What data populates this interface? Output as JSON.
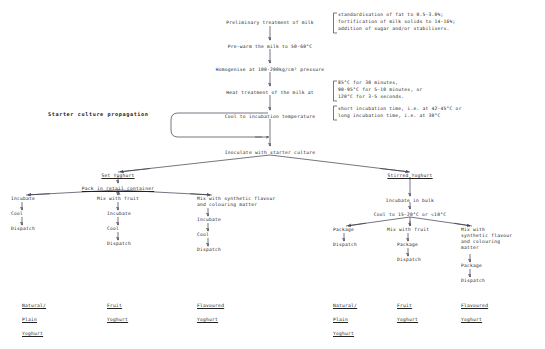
{
  "diagram": {
    "main_chain": [
      {
        "id": "prelim",
        "text": "Preliminary treatment of milk"
      },
      {
        "id": "prewarm",
        "text": "Pre-warm the milk to 50-60°C"
      },
      {
        "id": "homogenise",
        "text": "Homogenise at 100-200kg/cm² pressure"
      },
      {
        "id": "heat",
        "text": "Heat treatment of the milk at"
      },
      {
        "id": "cool",
        "text": "Cool to incubation temperature"
      },
      {
        "id": "inoculate",
        "text": "Inoculate with starter culture"
      }
    ],
    "brackets": [
      {
        "id": "prelim-note",
        "lines": [
          "standardisation of fat to 0.5-3.0%;",
          "fortification of milk solids to 14-16%;",
          "addition of sugar and/or stabilisers."
        ]
      },
      {
        "id": "heat-note",
        "lines": [
          "85°C for 30 minutes,",
          "90-95°C for 5-10 minutes, or",
          "120°C for 3-5 seconds."
        ]
      },
      {
        "id": "cool-note",
        "lines": [
          "short incubation time, i.e. at 42-45°C or",
          "long incubation time, i.e. at 30°C"
        ]
      }
    ],
    "starter_culture_label": "Starter culture propagation",
    "set_branch": {
      "heading": "Set Yoghurt",
      "subheading": "Pack in retail container",
      "paths": [
        {
          "id": "set-natural",
          "steps": [
            "Incubate",
            "Cool",
            "Dispatch"
          ]
        },
        {
          "id": "set-fruit",
          "steps": [
            "Mix with fruit",
            "Incubate",
            "Cool",
            "Dispatch"
          ]
        },
        {
          "id": "set-flavoured",
          "steps": [
            "Mix with synthetic flavour",
            "and colouring matter",
            "Incubate",
            "Cool",
            "Dispatch"
          ]
        }
      ]
    },
    "stirred_branch": {
      "heading": "Stirred Yoghurt",
      "step_incubate": "Incubate in bulk",
      "step_cool": "Cool to 15-20°C or <10°C",
      "paths": [
        {
          "id": "stirred-natural",
          "steps": [
            "Package",
            "Dispatch"
          ]
        },
        {
          "id": "stirred-fruit",
          "steps": [
            "Mix with fruit",
            "Package",
            "Dispatch"
          ]
        },
        {
          "id": "stirred-flavoured",
          "steps": [
            "Mix with",
            "synthetic flavour",
            "and colouring",
            "matter",
            "Package",
            "Dispatch"
          ]
        }
      ]
    },
    "products_left": [
      {
        "id": "left-natural",
        "lines": [
          "Natural/",
          "Plain",
          "Yoghurt"
        ]
      },
      {
        "id": "left-fruit",
        "lines": [
          "Fruit",
          "Yoghurt"
        ]
      },
      {
        "id": "left-flavoured",
        "lines": [
          "Flavoured",
          "Yoghurt"
        ]
      }
    ],
    "products_right": [
      {
        "id": "right-natural",
        "lines": [
          "Natural/",
          "Plain",
          "Yoghurt"
        ]
      },
      {
        "id": "right-fruit",
        "lines": [
          "Fruit",
          "Yoghurt"
        ]
      },
      {
        "id": "right-flavoured",
        "lines": [
          "Flavoured",
          "Yoghurt"
        ]
      }
    ],
    "colors": {
      "line": "#3a3a4a",
      "text": "#222222",
      "background": "#ffffff"
    }
  }
}
